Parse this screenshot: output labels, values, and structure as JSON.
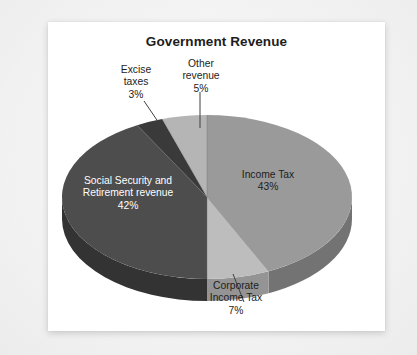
{
  "chart_data": {
    "type": "pie",
    "title": "Government Revenue",
    "xlabel": "",
    "ylabel": "",
    "legend_position": "none",
    "grid": false,
    "categories": [
      "Income Tax",
      "Corporate Income Tax",
      "Social Security and Retirement revenue",
      "Excise taxes",
      "Other revenue"
    ],
    "values": [
      43,
      7,
      42,
      3,
      5
    ],
    "value_labels": [
      "43%",
      "7%",
      "42%",
      "3%",
      "5%"
    ],
    "unit": "percent",
    "slices": [
      {
        "name": "Income Tax",
        "value": 43,
        "value_label": "43%",
        "color": "#9a9a9a",
        "side_color": "#737373",
        "label_lines": [
          "Income Tax",
          "43%"
        ],
        "label_placement": "inside",
        "label_text_color": "#1d1d1d",
        "leader_line": false
      },
      {
        "name": "Corporate Income Tax",
        "value": 7,
        "value_label": "7%",
        "color": "#bdbdbd",
        "side_color": "#949494",
        "label_lines": [
          "Corporate",
          "Income Tax",
          "7%"
        ],
        "label_placement": "outside-bottom",
        "label_text_color": "#1d1d1d",
        "leader_line": true
      },
      {
        "name": "Social Security and Retirement revenue",
        "value": 42,
        "value_label": "42%",
        "color": "#4d4d4d",
        "side_color": "#333333",
        "label_lines": [
          "Social Security and",
          "Retirement revenue",
          "42%"
        ],
        "label_placement": "inside",
        "label_text_color": "#ffffff",
        "leader_line": false
      },
      {
        "name": "Excise taxes",
        "value": 3,
        "value_label": "3%",
        "color": "#3a3a3a",
        "side_color": "#262626",
        "label_lines": [
          "Excise",
          "taxes",
          "3%"
        ],
        "label_placement": "outside-top",
        "label_text_color": "#1d1d1d",
        "leader_line": true
      },
      {
        "name": "Other revenue",
        "value": 5,
        "value_label": "5%",
        "color": "#b5b5b5",
        "side_color": "#8c8c8c",
        "label_lines": [
          "Other",
          "revenue",
          "5%"
        ],
        "label_placement": "outside-top",
        "label_text_color": "#1d1d1d",
        "leader_line": true
      }
    ]
  },
  "labels": {
    "income": {
      "l1": "Income Tax",
      "l2": "43%"
    },
    "corp": {
      "l1": "Corporate",
      "l2": "Income Tax",
      "l3": "7%"
    },
    "social": {
      "l1": "Social Security and",
      "l2": "Retirement revenue",
      "l3": "42%"
    },
    "excise": {
      "l1": "Excise",
      "l2": "taxes",
      "l3": "3%"
    },
    "other": {
      "l1": "Other",
      "l2": "revenue",
      "l3": "5%"
    }
  },
  "colors": {
    "card_background": "#ffffff",
    "page_background": "#f2f2f2",
    "title_text": "#1d1d1d",
    "leader_line": "#4a4a4a"
  }
}
